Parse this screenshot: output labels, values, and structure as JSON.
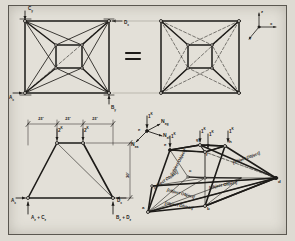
{
  "figure": {
    "background_color": "#e3e0d8",
    "ink_color": "#1d1b18",
    "equals_symbol": "="
  },
  "axes_indicator": {
    "name": "coordinate-axes",
    "z": "z",
    "x": "x",
    "y": "y"
  },
  "plan_left": {
    "name": "plan-view-with-reactions",
    "reactions": [
      {
        "id": "Cy",
        "base": "C",
        "sub": "y",
        "position": "top-left"
      },
      {
        "id": "Dx",
        "base": "D",
        "sub": "x",
        "position": "top-right"
      },
      {
        "id": "Ax",
        "base": "A",
        "sub": "x",
        "position": "bottom-left"
      },
      {
        "id": "By",
        "base": "B",
        "sub": "y",
        "position": "bottom-right"
      }
    ]
  },
  "plan_right": {
    "name": "plan-view-plain"
  },
  "elevation": {
    "name": "elevation-view",
    "dimensions_top": [
      "15'",
      "15'",
      "15'"
    ],
    "dimension_height": "30'",
    "loads": [
      {
        "value": "2",
        "unit": "K"
      },
      {
        "value": "2",
        "unit": "K"
      }
    ],
    "reactions": [
      {
        "base": "A",
        "sub": "x",
        "position": "left"
      },
      {
        "base": "D",
        "sub": "x",
        "position": "right"
      }
    ],
    "support_labels": [
      {
        "text": "A",
        "sub1": "z",
        "plus": "+",
        "text2": "C",
        "sub2": "z"
      },
      {
        "text": "B",
        "sub1": "z",
        "plus": "+",
        "text2": "D",
        "sub2": "z"
      }
    ]
  },
  "free_body": {
    "name": "joint-free-body-diagram",
    "joint": "e",
    "load": {
      "value": "1",
      "unit": "K"
    },
    "forces": [
      {
        "label": "N",
        "sub": "eg"
      },
      {
        "label": "N",
        "sub": "ef"
      },
      {
        "label": "N",
        "sub": "ea"
      }
    ]
  },
  "isometric": {
    "name": "isometric-truss-view",
    "loads": [
      {
        "value": "1",
        "unit": "K"
      },
      {
        "value": "1",
        "unit": "K"
      },
      {
        "value": "1",
        "unit": "K"
      },
      {
        "value": "1",
        "unit": "K"
      }
    ],
    "nodes": [
      "a",
      "b",
      "c",
      "d",
      "e",
      "f",
      "g",
      "h"
    ],
    "dimensions": [
      {
        "text": "45'",
        "kind": "base-front"
      },
      {
        "text": "45'",
        "kind": "base-right"
      },
      {
        "text": "15'",
        "kind": "inner"
      },
      {
        "text": "30'",
        "kind": "height"
      },
      {
        "text": "21.21'",
        "kind": "diagonal-base"
      },
      {
        "text": "38.71'",
        "kind": "diagonal-brace"
      }
    ]
  }
}
